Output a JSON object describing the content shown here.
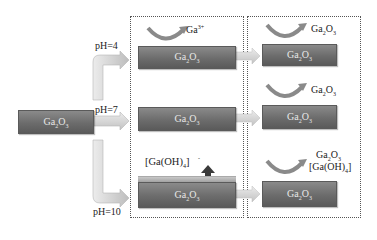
{
  "diagram": {
    "start": {
      "label_main": "Ga",
      "sub1": "2",
      "mid": "O",
      "sub2": "3"
    },
    "branches": [
      {
        "ph_label": "pH=4"
      },
      {
        "ph_label": "pH=7"
      },
      {
        "ph_label": "pH=10"
      }
    ],
    "middle_stage": {
      "blocks": [
        {
          "label": "Ga",
          "sub1": "2",
          "mid": "O",
          "sub2": "3"
        },
        {
          "label": "Ga",
          "sub1": "2",
          "mid": "O",
          "sub2": "3"
        },
        {
          "label": "Ga",
          "sub1": "2",
          "mid": "O",
          "sub2": "3"
        }
      ],
      "pH4_product": {
        "text": "Ga",
        "sup": "3+"
      },
      "pH10_product": {
        "prefix": "[Ga(OH)",
        "sub": "4",
        "suffix": "]",
        "sup": "-"
      }
    },
    "final_stage": {
      "blocks": [
        {
          "label": "Ga",
          "sub1": "2",
          "mid": "O",
          "sub2": "3"
        },
        {
          "label": "Ga",
          "sub1": "2",
          "mid": "O",
          "sub2": "3"
        },
        {
          "label": "Ga",
          "sub1": "2",
          "mid": "O",
          "sub2": "3"
        }
      ],
      "pH4_product": {
        "text": "Ga",
        "sub1": "2",
        "mid": "O",
        "sub2": "3"
      },
      "pH7_product": {
        "text": "Ga",
        "sub1": "2",
        "mid": "O",
        "sub2": "3"
      },
      "pH10_product_line1": {
        "text": "Ga",
        "sub1": "2",
        "mid": "O",
        "sub2": "3"
      },
      "pH10_product_line2": {
        "prefix": "[Ga(OH)",
        "sub": "4",
        "suffix": "]"
      }
    },
    "colors": {
      "block": "#6c6c6c",
      "arrow": "#d0d0d0",
      "dashed_border": "#555555",
      "up_arrow": "#3a3a3a"
    }
  }
}
